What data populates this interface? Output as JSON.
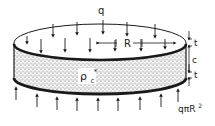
{
  "diagram": {
    "labels": {
      "load": "q",
      "radius": "R",
      "face_thickness_top": "t",
      "core_thickness": "c",
      "face_thickness_bottom": "t",
      "core_density_base": "ρ",
      "core_density_sub": "c",
      "core_density_sup": "*",
      "reaction_prefix": "qπR",
      "reaction_exp": "2"
    },
    "colors": {
      "line": "#1a1a1a",
      "background": "#ffffff",
      "core_fill": "#8c8c8c"
    },
    "arrows": {
      "top_down_count": 12,
      "bottom_up_count": 9
    }
  }
}
